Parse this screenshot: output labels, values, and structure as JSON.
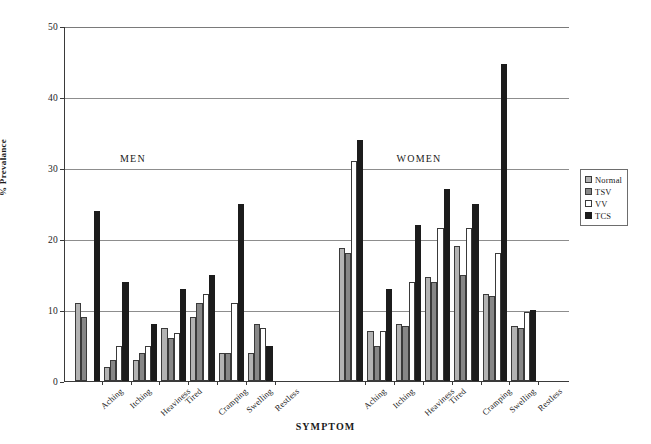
{
  "chart_data": {
    "type": "bar",
    "title": "",
    "xlabel": "SYMPTOM",
    "ylabel": "% Prevalance",
    "ylim": [
      0,
      50
    ],
    "yticks": [
      0,
      10,
      20,
      30,
      40,
      50
    ],
    "grid": true,
    "legend_position": "right",
    "legend": [
      "Normal",
      "TSV",
      "VV",
      "TCS"
    ],
    "series_colors": {
      "Normal": "#b3b3b3",
      "TSV": "#878787",
      "VV": "#ffffff",
      "TCS": "#1c1c1c"
    },
    "sections": [
      {
        "name": "MEN",
        "categories": [
          "Aching",
          "Itching",
          "Heaviness",
          "Tired",
          "Cramping",
          "Swelling",
          "Restless"
        ],
        "series": [
          {
            "name": "Normal",
            "values": [
              11.0,
              2.0,
              3.0,
              7.5,
              9.0,
              4.0,
              4.0
            ]
          },
          {
            "name": "TSV",
            "values": [
              9.0,
              3.0,
              4.0,
              6.0,
              11.0,
              4.0,
              8.0
            ]
          },
          {
            "name": "VV",
            "values": [
              0.0,
              5.0,
              5.0,
              6.7,
              12.2,
              11.0,
              7.5
            ]
          },
          {
            "name": "TCS",
            "values": [
              24.0,
              14.0,
              8.0,
              13.0,
              15.0,
              25.0,
              5.0
            ]
          }
        ]
      },
      {
        "name": "WOMEN",
        "categories": [
          "Aching",
          "Itching",
          "Heaviness",
          "Tired",
          "Cramping",
          "Swelling",
          "Restless"
        ],
        "series": [
          {
            "name": "Normal",
            "values": [
              18.8,
              7.0,
              8.0,
              14.7,
              19.0,
              12.3,
              7.8
            ]
          },
          {
            "name": "TSV",
            "values": [
              18.0,
              5.0,
              7.7,
              14.0,
              15.0,
              12.0,
              7.5
            ]
          },
          {
            "name": "VV",
            "values": [
              31.0,
              7.0,
              14.0,
              21.5,
              21.5,
              18.0,
              9.7
            ]
          },
          {
            "name": "TCS",
            "values": [
              34.0,
              13.0,
              22.0,
              27.0,
              25.0,
              44.7,
              10.0
            ]
          }
        ]
      }
    ]
  },
  "axis": {
    "y_title": "% Prevalance",
    "x_title": "SYMPTOM",
    "y_ticks": [
      "0",
      "10",
      "20",
      "30",
      "40",
      "50"
    ]
  },
  "legend": {
    "items": [
      {
        "label": "Normal",
        "swatch": "legend-swatch-normal"
      },
      {
        "label": "TSV",
        "swatch": "legend-swatch-tsv"
      },
      {
        "label": "VV",
        "swatch": "legend-swatch-vv"
      },
      {
        "label": "TCS",
        "swatch": "legend-swatch-tcs"
      }
    ]
  },
  "sections": {
    "men_caption": "MEN",
    "women_caption": "WOMEN"
  }
}
